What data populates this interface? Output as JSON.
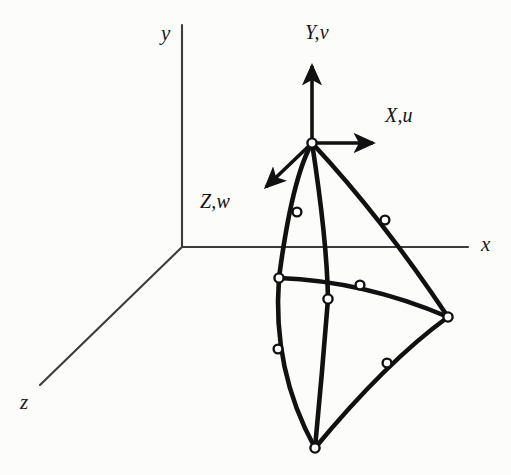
{
  "figure": {
    "background_color": "#fcfcfb",
    "ink_color": "#111111",
    "global_axes": {
      "origin": [
        182,
        247
      ],
      "color": "#3a3a3a",
      "labels": {
        "y": "y",
        "x": "x",
        "z": "z"
      },
      "label_positions": {
        "y": [
          161,
          23
        ],
        "x": [
          481,
          234
        ],
        "z": [
          20,
          392
        ]
      },
      "y_axis": {
        "from": [
          182,
          247
        ],
        "to": [
          182,
          25
        ]
      },
      "x_axis": {
        "from": [
          182,
          247
        ],
        "to": [
          468,
          247
        ]
      },
      "z_axis": {
        "from": [
          182,
          247
        ],
        "to": [
          40,
          385
        ]
      }
    },
    "local_axes": {
      "origin": [
        312,
        143
      ],
      "color": "#111111",
      "labels": {
        "Y": "Y,v",
        "X": "X,u",
        "Z": "Z,w"
      },
      "label_positions": {
        "Y": [
          305,
          22
        ],
        "X": [
          385,
          105
        ],
        "Z": [
          200,
          191
        ]
      },
      "Y_arrow": {
        "from": [
          312,
          143
        ],
        "to": [
          312,
          62
        ]
      },
      "X_arrow": {
        "from": [
          312,
          143
        ],
        "to": [
          378,
          143
        ]
      },
      "Z_arrow": {
        "from": [
          312,
          143
        ],
        "to": [
          262,
          191
        ]
      }
    },
    "element": {
      "type": "degenerated-curved-shell-element",
      "line_width": 4.6,
      "node_radius": 4.4,
      "node_fill": "#ffffff",
      "node_stroke": "#111111",
      "corner_nodes": [
        {
          "id": "n-top",
          "pos": [
            312,
            143
          ]
        },
        {
          "id": "n-right",
          "pos": [
            448,
            317
          ]
        },
        {
          "id": "n-bottom",
          "pos": [
            315,
            448
          ]
        },
        {
          "id": "n-left",
          "pos": [
            279,
            278
          ]
        },
        {
          "id": "n-center",
          "pos": [
            328,
            299
          ]
        }
      ],
      "mid_nodes": [
        {
          "id": "m-top-left",
          "pos": [
            297,
            212
          ]
        },
        {
          "id": "m-top-right",
          "pos": [
            385,
            220
          ]
        },
        {
          "id": "m-left-lower",
          "pos": [
            278,
            349
          ]
        },
        {
          "id": "m-right-lower",
          "pos": [
            387,
            363
          ]
        },
        {
          "id": "m-mid-right",
          "pos": [
            360,
            285
          ]
        }
      ],
      "edges": [
        {
          "id": "edge-top-to-left",
          "path": "M 312 143 Q 292 178 279 278"
        },
        {
          "id": "edge-left-to-bottom",
          "path": "M 279 278 Q 272 370 315 448"
        },
        {
          "id": "edge-top-to-right",
          "path": "M 312 143 Q 382 218 448 317"
        },
        {
          "id": "edge-right-to-bottom",
          "path": "M 448 317 Q 386 362 315 448"
        },
        {
          "id": "edge-top-to-center-bottom",
          "path": "M 312 143 Q 327 240 328 299"
        },
        {
          "id": "edge-center-to-bottom",
          "path": "M 328 299 Q 322 375 315 448"
        },
        {
          "id": "edge-left-to-right",
          "path": "M 279 278 Q 364 281 448 317"
        }
      ]
    }
  }
}
